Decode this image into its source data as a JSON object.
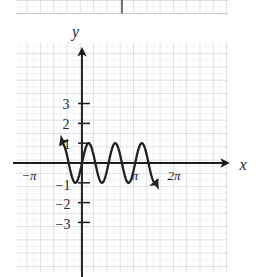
{
  "figure": {
    "title": "",
    "top_strip": {
      "description": "bottom edge of the grid of a preceding figure",
      "axis_line_x": 122
    },
    "axis_labels": {
      "y": "y",
      "x": "x"
    },
    "y_tick_labels": [
      "3",
      "2",
      "1",
      "−1",
      "−2",
      "−3"
    ],
    "x_tick_labels": [
      "−π",
      "π",
      "2π"
    ]
  },
  "chart_data": {
    "type": "line",
    "title": "",
    "xlabel": "x",
    "ylabel": "y",
    "function": "y = sin(4x)",
    "amplitude": 1,
    "period_in_x_units": 1.5707963,
    "grid": true,
    "grid_spacing_x_units": 0.25,
    "grid_spacing_y_units": 0.5,
    "legend": "none",
    "xlim": [
      -1.27,
      4.45
    ],
    "ylim": [
      -3.95,
      4.25
    ],
    "xticks": [
      -3.14159,
      3.14159,
      6.28319
    ],
    "xtick_labels": [
      "−π",
      "π",
      "2π"
    ],
    "yticks": [
      3,
      2,
      1,
      -1,
      -2,
      -3
    ],
    "ytick_labels": [
      "3",
      "2",
      "1",
      "−1",
      "−2",
      "−3"
    ],
    "arrows": {
      "curve_left_end": "arrow",
      "curve_right_end": "arrow",
      "x_axis_right": "arrow",
      "y_axis_top": "arrow"
    },
    "series": [
      {
        "name": "y = sin(4x)",
        "color": "#1f1f1f",
        "x": [
          -1.27,
          -1.2,
          -1.1,
          -1.0,
          -0.9,
          -0.8,
          -0.7,
          -0.6,
          -0.5,
          -0.4,
          -0.3,
          -0.2,
          -0.1,
          0.0,
          0.1,
          0.2,
          0.3,
          0.4,
          0.5,
          0.6,
          0.7,
          0.8,
          0.9,
          1.0,
          1.1,
          1.2,
          1.3,
          1.4,
          1.5,
          1.6,
          1.7,
          1.8,
          1.9,
          2.0,
          2.1,
          2.2,
          2.3,
          2.4,
          2.5,
          2.6,
          2.7,
          2.8,
          2.9,
          3.0,
          3.1,
          3.2,
          3.3,
          3.4,
          3.5,
          3.6,
          3.7,
          3.8,
          3.9,
          4.0,
          4.1,
          4.2,
          4.3,
          4.45
        ],
        "y": [
          0.41,
          0.68,
          0.95,
          0.76,
          0.44,
          0.06,
          -0.33,
          -0.68,
          -0.91,
          -1.0,
          -0.93,
          -0.72,
          -0.39,
          0.0,
          0.39,
          0.72,
          0.93,
          1.0,
          0.91,
          0.68,
          0.33,
          -0.06,
          -0.44,
          -0.76,
          -0.95,
          -1.0,
          -0.88,
          -0.59,
          -0.21,
          0.21,
          0.59,
          0.88,
          1.0,
          0.99,
          0.76,
          0.42,
          0.01,
          -0.41,
          -0.75,
          -0.96,
          -1.0,
          -0.86,
          -0.56,
          -0.17,
          0.25,
          0.63,
          0.9,
          1.0,
          0.91,
          0.65,
          0.29,
          -0.12,
          -0.51,
          -0.82,
          -0.98,
          -0.97,
          -0.79,
          -0.3
        ]
      }
    ]
  }
}
